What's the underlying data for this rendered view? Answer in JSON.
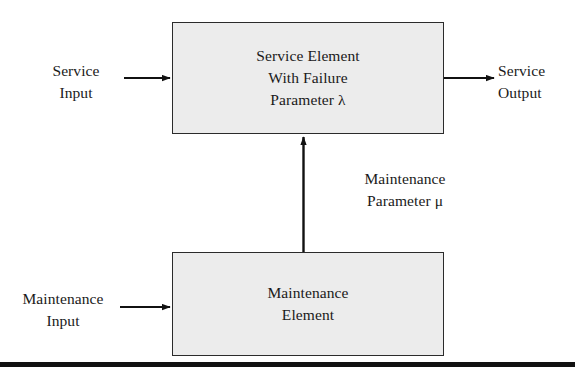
{
  "diagram": {
    "background_color": "#ffffff",
    "box_fill_color": "#ececec",
    "box_border_color": "#2b2b2b",
    "text_color": "#1a1a1a",
    "rule_color": "#111111"
  },
  "blocks": {
    "service": {
      "name": "service-element-block",
      "line1": "Service Element",
      "line2": "With Failure",
      "line3": "Parameter λ"
    },
    "maintenance": {
      "name": "maintenance-element-block",
      "line1": "Maintenance",
      "line2": "Element"
    }
  },
  "labels": {
    "service_input": {
      "line1": "Service",
      "line2": "Input"
    },
    "service_output": {
      "line1": "Service",
      "line2": "Output"
    },
    "maintenance_input": {
      "line1": "Maintenance",
      "line2": "Input"
    },
    "maintenance_parameter": {
      "line1": "Maintenance",
      "line2": "Parameter μ"
    }
  },
  "arrows": [
    {
      "name": "service-input-arrow",
      "from": "service-input-label",
      "to": "service-element-block",
      "direction": "right"
    },
    {
      "name": "service-output-arrow",
      "from": "service-element-block",
      "to": "service-output-label",
      "direction": "right"
    },
    {
      "name": "maintenance-input-arrow",
      "from": "maintenance-input-label",
      "to": "maintenance-element-block",
      "direction": "right"
    },
    {
      "name": "maintenance-parameter-arrow",
      "from": "maintenance-element-block",
      "to": "service-element-block",
      "direction": "up"
    }
  ]
}
